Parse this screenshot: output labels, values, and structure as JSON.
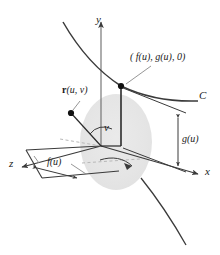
{
  "figure": {
    "background_color": "#ffffff",
    "line_color": "#3a3a3a",
    "surface_fill": "#e3e3e3",
    "dashed_color": "#b0b0b0",
    "point_color": "#111111"
  },
  "axes": {
    "y_label": "y",
    "x_label": "x",
    "z_label": "z"
  },
  "labels": {
    "curve_c": "C",
    "point_on_curve": "( f(u), g(u), 0)",
    "vector_r": "r(u, v)",
    "vector_r_bold": "r",
    "vector_r_args": "(u, v)",
    "angle_v": "v",
    "radius_f": "f(u)",
    "height_g": "g(u)"
  }
}
